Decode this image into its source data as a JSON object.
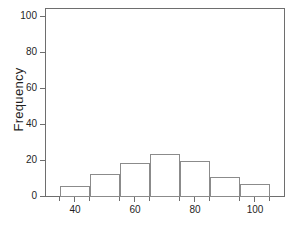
{
  "chart_data": {
    "type": "bar",
    "title": "",
    "subtitle": "",
    "xlabel": "",
    "ylabel": "Frequency",
    "grid": false,
    "legend": false,
    "bin_width": 10,
    "bin_edges": [
      35,
      45,
      55,
      65,
      75,
      85,
      95,
      105
    ],
    "categories": [
      "35-45",
      "45-55",
      "55-65",
      "65-75",
      "75-85",
      "85-95",
      "95-105"
    ],
    "values": [
      6,
      13,
      19,
      24,
      20,
      11,
      7
    ],
    "x": [
      40,
      50,
      60,
      70,
      80,
      90,
      100
    ],
    "xlim": [
      30,
      110
    ],
    "ylim": [
      0,
      105
    ],
    "y_ticks": [
      0,
      20,
      40,
      60,
      80,
      100
    ],
    "y_tick_labels": [
      "0",
      "20",
      "40",
      "60",
      "80",
      "100"
    ],
    "x_ticks": [
      40,
      60,
      80,
      100
    ],
    "x_tick_labels": [
      "40",
      "60",
      "80",
      "100"
    ],
    "x_minor_ticks": [
      35,
      45,
      55,
      65,
      75,
      85,
      95,
      105
    ],
    "bar_fill_color": "#ffffff",
    "bar_edge_color": "#8b8b8b",
    "axis_color": "#6e6e6e",
    "text_color": "#1f1f1f",
    "background_color": "#ffffff"
  },
  "caption_sliver": "",
  "axes": {
    "y_axis_title": "Frequency"
  }
}
